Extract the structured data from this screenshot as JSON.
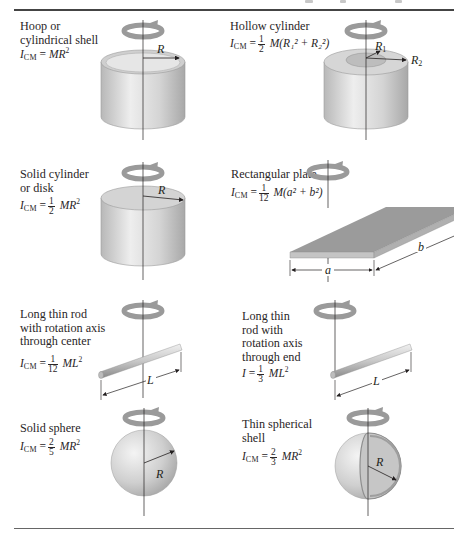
{
  "figure": {
    "shapes": [
      {
        "id": "hoop",
        "name_lines": [
          "Hoop or",
          "cylindrical shell"
        ],
        "formula": {
          "lhs": "I",
          "lhs_sub": "CM",
          "eq": "=",
          "coef_num": "",
          "coef_den": "",
          "rhs": "MR",
          "rhs_sup": "2"
        },
        "dims": [
          "R"
        ]
      },
      {
        "id": "hollow-cylinder",
        "name_lines": [
          "Hollow cylinder"
        ],
        "formula": {
          "lhs": "I",
          "lhs_sub": "CM",
          "eq": "=",
          "coef_num": "1",
          "coef_den": "2",
          "rhs": "M(R₁² + R₂²)"
        },
        "dims": [
          "R1",
          "R2"
        ]
      },
      {
        "id": "solid-cylinder",
        "name_lines": [
          "Solid cylinder",
          "or disk"
        ],
        "formula": {
          "lhs": "I",
          "lhs_sub": "CM",
          "eq": "=",
          "coef_num": "1",
          "coef_den": "2",
          "rhs": "MR",
          "rhs_sup": "2"
        },
        "dims": [
          "R"
        ]
      },
      {
        "id": "rectangular-plate",
        "name_lines": [
          "Rectangular plate"
        ],
        "formula": {
          "lhs": "I",
          "lhs_sub": "CM",
          "eq": "=",
          "coef_num": "1",
          "coef_den": "12",
          "rhs": "M(a² + b²)"
        },
        "dims": [
          "a",
          "b"
        ]
      },
      {
        "id": "rod-center",
        "name_lines": [
          "Long thin rod",
          "with rotation axis",
          "through center"
        ],
        "formula": {
          "lhs": "I",
          "lhs_sub": "CM",
          "eq": "=",
          "coef_num": "1",
          "coef_den": "12",
          "rhs": "ML",
          "rhs_sup": "2"
        },
        "dims": [
          "L"
        ]
      },
      {
        "id": "rod-end",
        "name_lines": [
          "Long thin",
          "rod with",
          "rotation axis",
          "through end"
        ],
        "formula": {
          "lhs": "I",
          "lhs_sub": "",
          "eq": "=",
          "coef_num": "1",
          "coef_den": "3",
          "rhs": "ML",
          "rhs_sup": "2"
        },
        "dims": [
          "L"
        ]
      },
      {
        "id": "solid-sphere",
        "name_lines": [
          "Solid sphere"
        ],
        "formula": {
          "lhs": "I",
          "lhs_sub": "CM",
          "eq": "=",
          "coef_num": "2",
          "coef_den": "5",
          "rhs": "MR",
          "rhs_sup": "2"
        },
        "dims": [
          "R"
        ]
      },
      {
        "id": "spherical-shell",
        "name_lines": [
          "Thin spherical",
          "shell"
        ],
        "formula": {
          "lhs": "I",
          "lhs_sub": "CM",
          "eq": "=",
          "coef_num": "2",
          "coef_den": "3",
          "rhs": "MR",
          "rhs_sup": "2"
        },
        "dims": [
          "R"
        ]
      }
    ],
    "dim_labels": {
      "R": "R",
      "R1": "R",
      "R1_sub": "1",
      "R2": "R",
      "R2_sub": "2",
      "a": "a",
      "b": "b",
      "L": "L"
    },
    "colors": {
      "shape_fill": "#d9d9d9",
      "shape_shadow": "#a9a9a9",
      "plate_top": "#9a9a9a",
      "line": "#231f20",
      "rule": "#555555"
    }
  }
}
